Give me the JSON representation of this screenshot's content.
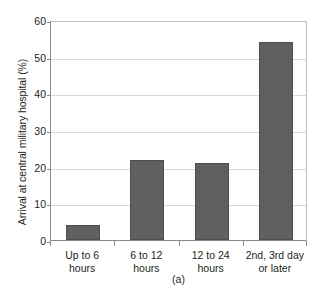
{
  "chart_data": {
    "type": "bar",
    "title": "",
    "subtitle": "",
    "caption": "(a)",
    "xlabel": "",
    "ylabel": "Arrival at central military hospital (%)",
    "categories": [
      "Up to 6 hours",
      "6 to 12 hours",
      "12 to 24 hours",
      "2nd, 3rd day or later"
    ],
    "category_lines": [
      [
        "Up to 6",
        "hours"
      ],
      [
        "6 to 12",
        "hours"
      ],
      [
        "12 to 24",
        "hours"
      ],
      [
        "2nd, 3rd day",
        "or later"
      ]
    ],
    "values": [
      4,
      21.7,
      21,
      54
    ],
    "ylim": [
      0,
      60
    ],
    "yticks": [
      0,
      10,
      20,
      30,
      40,
      50,
      60
    ],
    "ytick_labels": [
      "0",
      "10",
      "20",
      "30",
      "40",
      "50",
      "60"
    ],
    "grid": true,
    "grid_axis": "y",
    "legend": false,
    "legend_position": "none",
    "bar_color": "#606060",
    "bar_edge_color": "#4d4d4d",
    "grid_color": "#d9d9d9",
    "axis_color": "#8a8a8a",
    "background_color": "#ffffff",
    "text_color": "#231f20"
  }
}
